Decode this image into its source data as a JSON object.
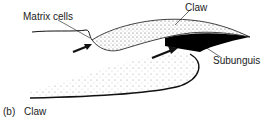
{
  "diagram": {
    "labels": {
      "matrix_cells": "Matrix cells",
      "claw": "Claw",
      "subunguis": "Subunguis"
    },
    "caption": {
      "panel": "(b)",
      "title": "Claw"
    },
    "colors": {
      "stroke": "#111111",
      "stipple": "#555555",
      "subunguis_fill": "#000000",
      "text": "#222222"
    }
  }
}
